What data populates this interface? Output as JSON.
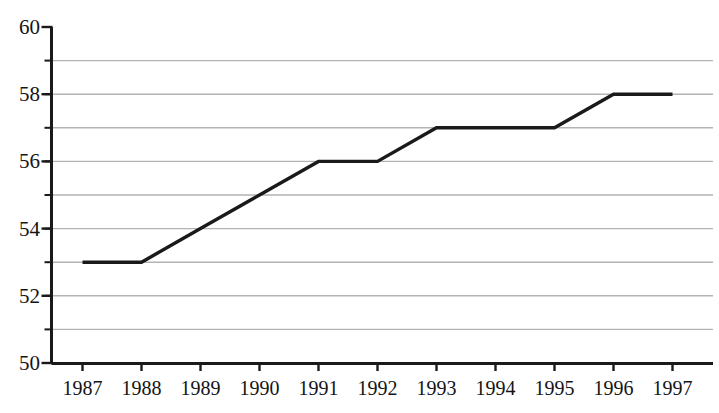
{
  "chart_data": {
    "type": "line",
    "title": "",
    "subtitle": "",
    "xlabel": "",
    "ylabel": "",
    "categories": [
      "1987",
      "1988",
      "1989",
      "1990",
      "1991",
      "1992",
      "1993",
      "1994",
      "1995",
      "1996",
      "1997"
    ],
    "x": [
      1987,
      1988,
      1989,
      1990,
      1991,
      1992,
      1993,
      1994,
      1995,
      1996,
      1997
    ],
    "values": [
      53,
      53,
      54,
      55,
      56,
      56,
      57,
      57,
      57,
      58,
      58
    ],
    "series": [
      {
        "name": "",
        "values": [
          53,
          53,
          54,
          55,
          56,
          56,
          57,
          57,
          57,
          58,
          58
        ]
      }
    ],
    "ylim": [
      50,
      60
    ],
    "y_tick_labels": [
      "50",
      "52",
      "54",
      "56",
      "58",
      "60"
    ],
    "y_tick_values": [
      50,
      52,
      54,
      56,
      58,
      60
    ],
    "y_gridline_values": [
      51,
      52,
      53,
      54,
      55,
      56,
      57,
      58,
      59
    ],
    "y_tick_interval": 2,
    "y_grid_interval": 1,
    "grid": true,
    "grid_axis": "y",
    "legend": false,
    "legend_position": "none",
    "annotations": [],
    "colors": {
      "line": "#1a1a1a",
      "grid": "#b3b3b3",
      "axis": "#1a1a1a",
      "background": "#ffffff",
      "text": "#141414"
    },
    "line_width": 3,
    "markers": false
  }
}
